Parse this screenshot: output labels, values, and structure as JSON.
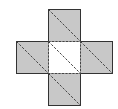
{
  "diagram": {
    "colors": {
      "background": "#ffffff",
      "shaded_fill": "#c8c8c8",
      "center_fill": "#ffffff",
      "outline": "#333333",
      "dashed_line": "#444444"
    },
    "squares": [
      {
        "id": "top",
        "x": 48,
        "y": 9,
        "size": 32,
        "shaded": true,
        "outline": "solid"
      },
      {
        "id": "left",
        "x": 16,
        "y": 41,
        "size": 32,
        "shaded": true,
        "outline": "solid"
      },
      {
        "id": "center",
        "x": 48,
        "y": 41,
        "size": 32,
        "shaded": false,
        "outline": "dashed"
      },
      {
        "id": "right",
        "x": 80,
        "y": 41,
        "size": 32,
        "shaded": true,
        "outline": "solid"
      },
      {
        "id": "bottom",
        "x": 48,
        "y": 73,
        "size": 32,
        "shaded": true,
        "outline": "solid"
      }
    ],
    "diagonals": "dashed, top-left to bottom-right in every square"
  }
}
